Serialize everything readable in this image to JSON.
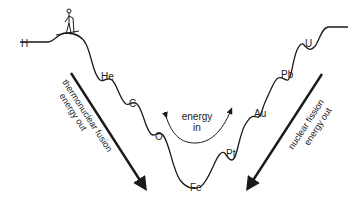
{
  "diagram": {
    "elements": [
      {
        "symbol": "H",
        "x": 20,
        "y": 43
      },
      {
        "symbol": "He",
        "x": 100,
        "y": 80
      },
      {
        "symbol": "C",
        "x": 130,
        "y": 106
      },
      {
        "symbol": "O",
        "x": 155,
        "y": 138
      },
      {
        "symbol": "Fe",
        "x": 191,
        "y": 190
      },
      {
        "symbol": "Pt",
        "x": 226,
        "y": 158
      },
      {
        "symbol": "Au",
        "x": 254,
        "y": 117
      },
      {
        "symbol": "Pb",
        "x": 281,
        "y": 78
      },
      {
        "symbol": "U",
        "x": 304,
        "y": 46
      }
    ],
    "fusion_label": {
      "line1": "thermonuclear fusion",
      "line2": "energy out"
    },
    "fission_label": {
      "line1": "nuclear fission",
      "line2": "energy out"
    },
    "energy_in_label": {
      "line1": "energy",
      "line2": "in"
    },
    "colors": {
      "line": "#1a1a1a",
      "text": "#222222",
      "background": "#ffffff"
    }
  }
}
